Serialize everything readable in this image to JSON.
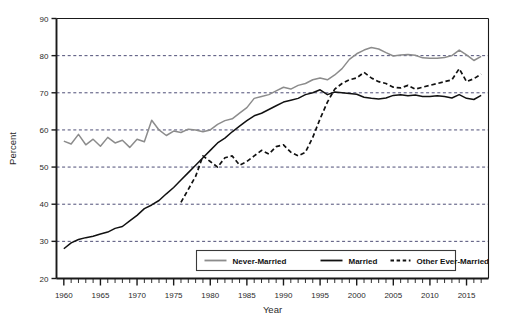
{
  "chart_data": {
    "type": "line",
    "title": "",
    "xlabel": "Year",
    "ylabel": "Percent",
    "xlim": [
      1959,
      2018
    ],
    "ylim": [
      20,
      90
    ],
    "yticks": [
      20,
      30,
      40,
      50,
      60,
      70,
      80,
      90
    ],
    "xticks": [
      1960,
      1965,
      1970,
      1975,
      1980,
      1985,
      1990,
      1995,
      2000,
      2005,
      2010,
      2015
    ],
    "xtick_labels": [
      "1960",
      "1965",
      "1970",
      "1975",
      "1980",
      "1985",
      "1990",
      "1995",
      "2000",
      "2005",
      "2010",
      "2015"
    ],
    "ytick_labels": [
      "20",
      "30",
      "40",
      "50",
      "60",
      "70",
      "80",
      "90"
    ],
    "grid": "horizontal-dashed",
    "minor_xticks_interval": 1,
    "legend_position": "bottom-center",
    "series": [
      {
        "name": "Never-Married",
        "color": "#8c8c8c",
        "style": "solid",
        "x": [
          1960,
          1961,
          1962,
          1963,
          1964,
          1965,
          1966,
          1967,
          1968,
          1969,
          1970,
          1971,
          1972,
          1973,
          1974,
          1975,
          1976,
          1977,
          1978,
          1979,
          1980,
          1981,
          1982,
          1983,
          1984,
          1985,
          1986,
          1987,
          1988,
          1989,
          1990,
          1991,
          1992,
          1993,
          1994,
          1995,
          1996,
          1997,
          1998,
          1999,
          2000,
          2001,
          2002,
          2003,
          2004,
          2005,
          2006,
          2007,
          2008,
          2009,
          2010,
          2011,
          2012,
          2013,
          2014,
          2015,
          2016,
          2017
        ],
        "values": [
          57.0,
          56.2,
          58.8,
          56.0,
          57.5,
          55.6,
          58.0,
          56.5,
          57.2,
          55.3,
          57.5,
          56.8,
          62.6,
          60.0,
          58.5,
          59.7,
          59.3,
          60.2,
          60.0,
          59.5,
          60.0,
          61.5,
          62.5,
          63.0,
          64.5,
          66.0,
          68.5,
          69.0,
          69.5,
          70.5,
          71.5,
          71.0,
          72.0,
          72.5,
          73.5,
          74.0,
          73.5,
          74.8,
          76.5,
          79.0,
          80.5,
          81.5,
          82.2,
          81.8,
          80.8,
          79.9,
          80.2,
          80.3,
          80.1,
          79.4,
          79.3,
          79.3,
          79.5,
          80.0,
          81.5,
          80.2,
          78.7,
          79.8
        ]
      },
      {
        "name": "Married",
        "color": "#111111",
        "style": "solid",
        "x": [
          1960,
          1961,
          1962,
          1963,
          1964,
          1965,
          1966,
          1967,
          1968,
          1969,
          1970,
          1971,
          1972,
          1973,
          1974,
          1975,
          1976,
          1977,
          1978,
          1979,
          1980,
          1981,
          1982,
          1983,
          1984,
          1985,
          1986,
          1987,
          1988,
          1989,
          1990,
          1991,
          1992,
          1993,
          1994,
          1995,
          1996,
          1997,
          1998,
          1999,
          2000,
          2001,
          2002,
          2003,
          2004,
          2005,
          2006,
          2007,
          2008,
          2009,
          2010,
          2011,
          2012,
          2013,
          2014,
          2015,
          2016,
          2017
        ],
        "values": [
          28.0,
          29.6,
          30.5,
          31.0,
          31.4,
          32.0,
          32.5,
          33.5,
          34.0,
          35.5,
          37.0,
          38.8,
          39.8,
          41.0,
          42.8,
          44.5,
          46.5,
          48.5,
          50.5,
          52.5,
          54.5,
          56.5,
          57.8,
          59.5,
          61.0,
          62.5,
          63.8,
          64.5,
          65.5,
          66.5,
          67.5,
          68.0,
          68.5,
          69.5,
          70.0,
          70.8,
          69.5,
          70.2,
          70.0,
          69.8,
          69.6,
          68.8,
          68.5,
          68.3,
          68.6,
          69.3,
          69.5,
          69.2,
          69.4,
          69.0,
          69.0,
          69.2,
          69.0,
          68.6,
          69.5,
          68.5,
          68.2,
          69.3
        ]
      },
      {
        "name": "Other Ever-Married",
        "color": "#111111",
        "style": "dashed",
        "x": [
          1976,
          1977,
          1978,
          1979,
          1980,
          1981,
          1982,
          1983,
          1984,
          1985,
          1986,
          1987,
          1988,
          1989,
          1990,
          1991,
          1992,
          1993,
          1994,
          1995,
          1996,
          1997,
          1998,
          1999,
          2000,
          2001,
          2002,
          2003,
          2004,
          2005,
          2006,
          2007,
          2008,
          2009,
          2010,
          2011,
          2012,
          2013,
          2014,
          2015,
          2016,
          2017
        ],
        "values": [
          40.5,
          44.0,
          47.5,
          53.0,
          51.5,
          50.0,
          52.5,
          53.0,
          50.5,
          51.5,
          53.0,
          54.5,
          53.5,
          55.5,
          56.0,
          54.0,
          53.0,
          54.0,
          58.0,
          63.0,
          67.5,
          71.0,
          72.5,
          73.5,
          74.0,
          75.5,
          74.0,
          73.0,
          72.5,
          71.5,
          71.3,
          72.0,
          71.0,
          71.5,
          72.0,
          72.5,
          73.0,
          73.5,
          76.5,
          73.0,
          73.8,
          75.0
        ]
      }
    ]
  },
  "legend": {
    "entries": [
      {
        "label": "Never-Married"
      },
      {
        "label": "Married"
      },
      {
        "label": "Other Ever-Married"
      }
    ]
  }
}
